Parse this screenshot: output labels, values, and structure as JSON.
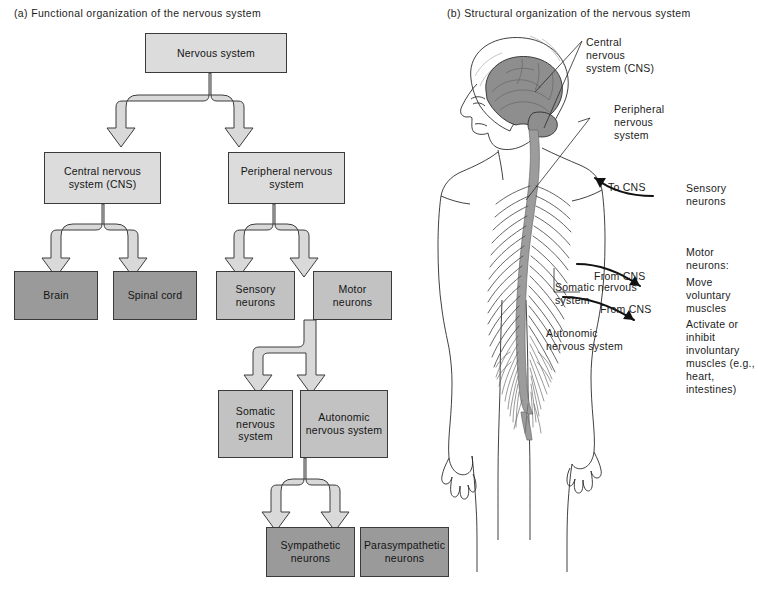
{
  "panels": {
    "a_caption": "(a) Functional organization of the nervous system",
    "b_caption": "(b) Structural organization of the nervous system"
  },
  "flowchart": {
    "nodes": [
      {
        "id": "nervous-system",
        "label": "Nervous system",
        "tone": "light"
      },
      {
        "id": "cns",
        "label": "Central nervous system (CNS)",
        "tone": "light"
      },
      {
        "id": "pns",
        "label": "Peripheral nervous system",
        "tone": "light"
      },
      {
        "id": "brain",
        "label": "Brain",
        "tone": "dark"
      },
      {
        "id": "spinal-cord",
        "label": "Spinal cord",
        "tone": "dark"
      },
      {
        "id": "sensory-neurons",
        "label": "Sensory neurons",
        "tone": "mid"
      },
      {
        "id": "motor-neurons",
        "label": "Motor neurons",
        "tone": "mid"
      },
      {
        "id": "somatic-nervous-system",
        "label": "Somatic nervous system",
        "tone": "mid"
      },
      {
        "id": "autonomic-nervous-system",
        "label": "Autonomic nervous system",
        "tone": "mid"
      },
      {
        "id": "sympathetic-neurons",
        "label": "Sympathetic neurons",
        "tone": "dark"
      },
      {
        "id": "parasympathetic-neurons",
        "label": "Parasympathetic neurons",
        "tone": "dark"
      }
    ]
  },
  "anatomy": {
    "labels": [
      {
        "id": "central-nervous-system",
        "text": "Central nervous system (CNS)"
      },
      {
        "id": "peripheral-nervous-system",
        "text": "Peripheral nervous system"
      },
      {
        "id": "to-cns",
        "text": "To CNS"
      },
      {
        "id": "sensory-neurons",
        "text": "Sensory neurons"
      },
      {
        "id": "from-cns-motor",
        "text": "From CNS"
      },
      {
        "id": "motor-neurons",
        "text": "Motor neurons:"
      },
      {
        "id": "move-voluntary-muscles",
        "text": "Move voluntary muscles"
      },
      {
        "id": "somatic-nervous-system",
        "text": "Somatic nervous system"
      },
      {
        "id": "from-cns-autonomic",
        "text": "From CNS"
      },
      {
        "id": "autonomic-nervous-system",
        "text": "Autonomic nervous system"
      },
      {
        "id": "activate-inhibit",
        "text": "Activate or inhibit involuntary muscles (e.g., heart, intestines)"
      }
    ]
  },
  "colors": {
    "box_light": "#dcdcdc",
    "box_mid": "#c2c2c2",
    "box_dark": "#9a9a9a",
    "arrow_fill": "#d9d9d9",
    "outline": "#3a3a3a",
    "brain_gray": "#8e8e8e",
    "cord_gray": "#9c9c9c",
    "background": "#ffffff"
  }
}
